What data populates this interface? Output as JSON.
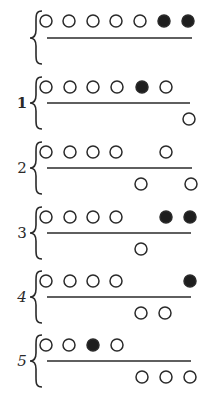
{
  "figure": {
    "width": 218,
    "height": 396,
    "ink_color": "#2a2a2a",
    "fill_color": "#1e1e1e",
    "background": "#ffffff",
    "circle_radius": 6,
    "groups": [
      {
        "label": "",
        "brace_x": 36,
        "top_y": 21,
        "line_y": 38,
        "bottom_y": 54,
        "line_x1": 47,
        "line_x2": 192,
        "top": [
          {
            "x": 46,
            "filled": false
          },
          {
            "x": 69,
            "filled": false
          },
          {
            "x": 93,
            "filled": false
          },
          {
            "x": 116,
            "filled": false
          },
          {
            "x": 140,
            "filled": false
          },
          {
            "x": 164,
            "filled": true
          },
          {
            "x": 188,
            "filled": true
          }
        ],
        "bottom": []
      },
      {
        "label": "1",
        "brace_x": 36,
        "top_y": 87,
        "line_y": 103,
        "bottom_y": 119,
        "line_x1": 47,
        "line_x2": 190,
        "top": [
          {
            "x": 46,
            "filled": false
          },
          {
            "x": 70,
            "filled": false
          },
          {
            "x": 93,
            "filled": false
          },
          {
            "x": 117,
            "filled": false
          },
          {
            "x": 142,
            "filled": true
          },
          {
            "x": 166,
            "filled": false
          }
        ],
        "bottom": [
          {
            "x": 189,
            "filled": false
          }
        ]
      },
      {
        "label": "2",
        "brace_x": 36,
        "top_y": 152,
        "line_y": 168,
        "bottom_y": 184,
        "line_x1": 47,
        "line_x2": 192,
        "top": [
          {
            "x": 46,
            "filled": false
          },
          {
            "x": 70,
            "filled": false
          },
          {
            "x": 93,
            "filled": false
          },
          {
            "x": 116,
            "filled": false
          },
          {
            "x": 166,
            "filled": false
          }
        ],
        "bottom": [
          {
            "x": 141,
            "filled": false
          },
          {
            "x": 191,
            "filled": false
          }
        ]
      },
      {
        "label": "3",
        "brace_x": 36,
        "top_y": 217,
        "line_y": 233,
        "bottom_y": 249,
        "line_x1": 47,
        "line_x2": 191,
        "top": [
          {
            "x": 46,
            "filled": false
          },
          {
            "x": 70,
            "filled": false
          },
          {
            "x": 93,
            "filled": false
          },
          {
            "x": 116,
            "filled": false
          },
          {
            "x": 166,
            "filled": true
          },
          {
            "x": 190,
            "filled": true
          }
        ],
        "bottom": [
          {
            "x": 141,
            "filled": false
          }
        ]
      },
      {
        "label": "4",
        "brace_x": 36,
        "top_y": 281,
        "line_y": 297,
        "bottom_y": 313,
        "line_x1": 47,
        "line_x2": 191,
        "top": [
          {
            "x": 46,
            "filled": false
          },
          {
            "x": 70,
            "filled": false
          },
          {
            "x": 93,
            "filled": false
          },
          {
            "x": 116,
            "filled": false
          },
          {
            "x": 190,
            "filled": true
          }
        ],
        "bottom": [
          {
            "x": 141,
            "filled": false
          },
          {
            "x": 165,
            "filled": false
          }
        ]
      },
      {
        "label": "5",
        "brace_x": 36,
        "top_y": 345,
        "line_y": 361,
        "bottom_y": 377,
        "line_x1": 47,
        "line_x2": 191,
        "top": [
          {
            "x": 46,
            "filled": false
          },
          {
            "x": 69,
            "filled": false
          },
          {
            "x": 93,
            "filled": true
          },
          {
            "x": 117,
            "filled": false
          }
        ],
        "bottom": [
          {
            "x": 142,
            "filled": false
          },
          {
            "x": 166,
            "filled": false
          },
          {
            "x": 190,
            "filled": false
          }
        ]
      }
    ]
  }
}
